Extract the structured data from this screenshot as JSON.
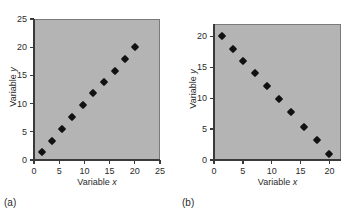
{
  "figure": {
    "panel_a_caption": "(a)",
    "panel_b_caption": "(b)"
  },
  "chart_data": [
    {
      "type": "scatter",
      "panel": "(a)",
      "title": "",
      "xlabel": "Variable x",
      "ylabel": "Variable y",
      "xlim": [
        0,
        25
      ],
      "ylim": [
        0,
        25
      ],
      "xticks": [
        0,
        5,
        10,
        15,
        20,
        25
      ],
      "yticks": [
        0,
        5,
        10,
        15,
        20,
        25
      ],
      "xtick_labels": [
        "0",
        "5",
        "10",
        "15",
        "20",
        "25"
      ],
      "ytick_labels": [
        "0",
        "5",
        "10",
        "15",
        "20",
        "25"
      ],
      "grid": false,
      "legend": "none",
      "marker": "diamond",
      "marker_color": "#111111",
      "plot_background": "#b4b4b4",
      "x": [
        1.5,
        3.5,
        5.5,
        7.6,
        9.7,
        11.7,
        13.9,
        16.0,
        18.0,
        20.0
      ],
      "y": [
        1.4,
        3.4,
        5.5,
        7.6,
        9.7,
        11.8,
        13.8,
        15.8,
        17.9,
        20.0
      ]
    },
    {
      "type": "scatter",
      "panel": "(b)",
      "title": "",
      "xlabel": "Variable x",
      "ylabel": "Variable y",
      "xlim": [
        0,
        22
      ],
      "ylim": [
        0,
        22
      ],
      "xticks": [
        0,
        5,
        10,
        15,
        20
      ],
      "yticks": [
        0,
        5,
        10,
        15,
        20
      ],
      "xtick_labels": [
        "0",
        "5",
        "10",
        "15",
        "20"
      ],
      "ytick_labels": [
        "0",
        "5",
        "10",
        "15",
        "20"
      ],
      "grid": false,
      "legend": "none",
      "marker": "diamond",
      "marker_color": "#111111",
      "plot_background": "#b4b4b4",
      "x": [
        1.4,
        3.3,
        5.1,
        7.1,
        9.2,
        11.3,
        13.4,
        15.6,
        17.8,
        19.9
      ],
      "y": [
        20.0,
        17.9,
        16.0,
        14.0,
        11.9,
        9.8,
        7.7,
        5.3,
        3.2,
        1.0
      ]
    }
  ]
}
